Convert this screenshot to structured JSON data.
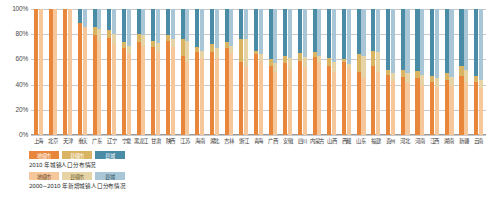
{
  "chart_data": {
    "type": "bar",
    "title": "",
    "xlabel": "",
    "ylabel": "",
    "ylim": [
      0,
      100
    ],
    "ytick_labels": [
      "0%",
      "20%",
      "40%",
      "60%",
      "80%",
      "100%"
    ],
    "ytick_values": [
      0,
      20,
      40,
      60,
      80,
      100
    ],
    "grid": true,
    "stacked": true,
    "grouped": true,
    "legend_position": "below-plot-left",
    "segment_names": [
      "地级市",
      "县级市",
      "县城"
    ],
    "categories": [
      "上海",
      "北京",
      "天津",
      "重庆",
      "广东",
      "辽宁",
      "宁夏",
      "黑龙江",
      "甘肃",
      "陕西",
      "江苏",
      "海南",
      "湖北",
      "吉林",
      "浙江",
      "青海",
      "广西",
      "安徽",
      "四川",
      "内蒙古",
      "山西",
      "西藏",
      "山东",
      "福建",
      "贵州",
      "河北",
      "河南",
      "江西",
      "湖南",
      "新疆",
      "云南"
    ],
    "series": [
      {
        "name": "2010 年城镇人口分布情况",
        "style": "saturated",
        "segments": [
          {
            "name": "地级市",
            "color": "#E8873C",
            "values": [
              100,
              100,
              100,
              89,
              79,
              77,
              69,
              74,
              70,
              75,
              63,
              66,
              66,
              69,
              58,
              64,
              55,
              57,
              59,
              62,
              55,
              58,
              50,
              55,
              48,
              46,
              45,
              42,
              44,
              47,
              42
            ]
          },
          {
            "name": "县级市",
            "color": "#D9B463",
            "values": [
              0,
              0,
              0,
              0,
              7,
              6,
              5,
              6,
              5,
              4,
              13,
              4,
              6,
              5,
              18,
              3,
              5,
              6,
              6,
              4,
              6,
              2,
              14,
              12,
              4,
              6,
              6,
              5,
              5,
              8,
              5
            ]
          },
          {
            "name": "县城",
            "color": "#4A8CA6",
            "values": [
              0,
              0,
              0,
              11,
              14,
              17,
              26,
              20,
              25,
              21,
              24,
              30,
              28,
              26,
              24,
              33,
              40,
              37,
              35,
              34,
              39,
              40,
              36,
              33,
              48,
              48,
              49,
              53,
              51,
              45,
              53
            ]
          }
        ]
      },
      {
        "name": "2000~2010 年新增城镇人口分布情况",
        "style": "pale",
        "segments": [
          {
            "name": "地级市",
            "color": "#F6C79A",
            "values": [
              100,
              100,
              100,
              86,
              75,
              72,
              64,
              71,
              66,
              70,
              58,
              61,
              61,
              64,
              54,
              59,
              50,
              52,
              54,
              57,
              50,
              53,
              45,
              50,
              43,
              41,
              40,
              38,
              39,
              42,
              37
            ]
          },
          {
            "name": "县级市",
            "color": "#E6D4A6",
            "values": [
              0,
              0,
              0,
              0,
              9,
              8,
              7,
              8,
              7,
              6,
              17,
              6,
              8,
              7,
              22,
              5,
              7,
              9,
              8,
              6,
              8,
              3,
              18,
              16,
              6,
              8,
              8,
              7,
              7,
              10,
              7
            ]
          },
          {
            "name": "县城",
            "color": "#A8C6D6",
            "values": [
              0,
              0,
              0,
              14,
              16,
              20,
              29,
              21,
              27,
              24,
              25,
              33,
              31,
              29,
              24,
              36,
              43,
              39,
              38,
              37,
              42,
              44,
              37,
              34,
              51,
              51,
              52,
              55,
              54,
              48,
              56
            ]
          }
        ]
      }
    ]
  },
  "legend": {
    "block_a": {
      "items": [
        "地级市",
        "县级市",
        "县城"
      ],
      "caption": "2010 年城镇人口分布情况"
    },
    "block_b": {
      "items": [
        "地级市",
        "县级市",
        "县城"
      ],
      "caption": "2000~2010 年新增城镇人口分布情况"
    }
  }
}
